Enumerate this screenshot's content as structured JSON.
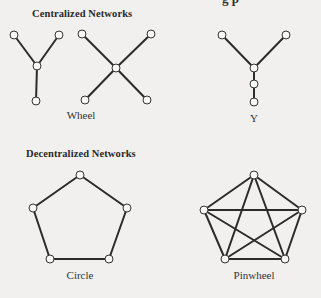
{
  "page_fragment_top": "g  p",
  "sections": [
    {
      "heading": "Centralized Networks",
      "networks": [
        {
          "name": "Wheel",
          "nodes": [
            [
              14,
              35
            ],
            [
              59,
              35
            ],
            [
              37,
              66
            ],
            [
              36,
              101
            ],
            [
              82,
              34
            ],
            [
              151,
              34
            ],
            [
              116,
              68
            ],
            [
              85,
              100
            ],
            [
              147,
              100
            ]
          ],
          "edges": [
            [
              0,
              2
            ],
            [
              1,
              2
            ],
            [
              2,
              3
            ],
            [
              4,
              6
            ],
            [
              5,
              6
            ],
            [
              6,
              7
            ],
            [
              6,
              8
            ]
          ]
        },
        {
          "name": "Y",
          "nodes": [
            [
              222,
              35
            ],
            [
              286,
              35
            ],
            [
              254,
              68
            ],
            [
              254,
              84
            ],
            [
              254,
              102
            ]
          ],
          "edges": [
            [
              0,
              2
            ],
            [
              1,
              2
            ],
            [
              2,
              3
            ],
            [
              3,
              4
            ]
          ]
        }
      ]
    },
    {
      "heading": "Decentralized Networks",
      "networks": [
        {
          "name": "Circle",
          "nodes": [
            [
              80,
              175
            ],
            [
              127,
              208
            ],
            [
              109,
              259
            ],
            [
              50,
              259
            ],
            [
              33,
              208
            ]
          ],
          "edges": [
            [
              0,
              1
            ],
            [
              1,
              2
            ],
            [
              2,
              3
            ],
            [
              3,
              4
            ],
            [
              4,
              0
            ]
          ]
        },
        {
          "name": "Pinwheel",
          "nodes": [
            [
              254,
              175
            ],
            [
              302,
              210
            ],
            [
              285,
              259
            ],
            [
              225,
              259
            ],
            [
              204,
              210
            ]
          ],
          "edges": [
            [
              0,
              1
            ],
            [
              1,
              2
            ],
            [
              2,
              3
            ],
            [
              3,
              4
            ],
            [
              4,
              0
            ],
            [
              0,
              2
            ],
            [
              0,
              3
            ],
            [
              1,
              3
            ],
            [
              1,
              4
            ],
            [
              2,
              4
            ]
          ]
        }
      ]
    }
  ]
}
